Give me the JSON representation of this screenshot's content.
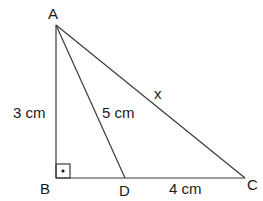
{
  "diagram": {
    "type": "geometry",
    "points": {
      "A": {
        "label": "A"
      },
      "B": {
        "label": "B"
      },
      "C": {
        "label": "C"
      },
      "D": {
        "label": "D"
      }
    },
    "measurements": {
      "AB": "3 cm",
      "AD": "5 cm",
      "AC": "x",
      "DC": "4 cm"
    },
    "right_angle_at": "B",
    "colors": {
      "line": "#3a3a3a",
      "text": "#1a1a1a",
      "background": "#ffffff"
    }
  }
}
